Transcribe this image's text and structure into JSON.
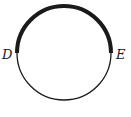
{
  "diagram": {
    "type": "circle-with-highlighted-arc",
    "circle": {
      "cx": 64,
      "cy": 53,
      "r": 47,
      "stroke": "#1a1a1a",
      "thin_width": 1.3,
      "thick_width": 4
    },
    "points": [
      {
        "name": "D",
        "label": "D",
        "x": 17,
        "y": 53
      },
      {
        "name": "E",
        "label": "E",
        "x": 111,
        "y": 53
      }
    ],
    "highlighted_arc": {
      "from": "D",
      "to": "E",
      "side": "upper"
    }
  }
}
